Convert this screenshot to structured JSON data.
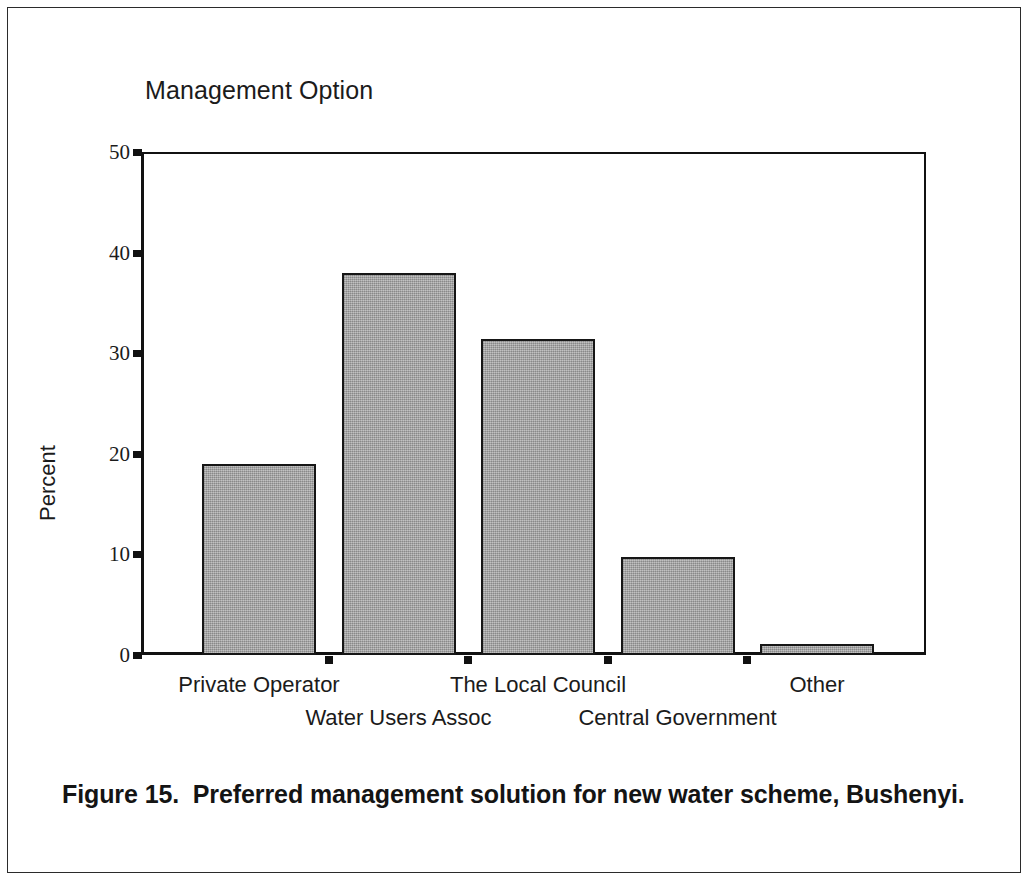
{
  "page": {
    "background": "#ffffff",
    "border_color": "#2b2b2b"
  },
  "chart_data": {
    "type": "bar",
    "title": "Management Option",
    "xlabel": "",
    "ylabel": "Percent",
    "categories": [
      "Private Operator",
      "Water Users Assoc",
      "The Local Council",
      "Central Government",
      "Other"
    ],
    "values": [
      19.0,
      38.0,
      31.4,
      9.7,
      1.1
    ],
    "ylim": [
      0,
      50
    ],
    "yticks": [
      0,
      10,
      20,
      30,
      40,
      50
    ],
    "ytick_labels": [
      "0",
      "10",
      "20",
      "30",
      "40",
      "50"
    ],
    "grid": false,
    "legend": null,
    "bar_fill_color": "#a9a9a9",
    "bar_edge_color": "#161616",
    "axis_color": "#111111"
  },
  "caption": {
    "text": "Figure 15.  Preferred management solution for new water scheme, Bushenyi."
  }
}
